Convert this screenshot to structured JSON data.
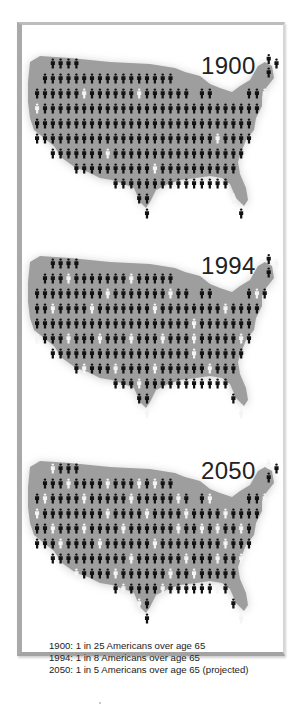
{
  "colors": {
    "map": "#9e9e9e",
    "person": "#111111",
    "elderly": "#f4f4f4",
    "frame": "#a9a9a9"
  },
  "grid": {
    "x0": 37,
    "dx": 7.85,
    "dy": 15
  },
  "maps": [
    {
      "year": "1900",
      "top": 22,
      "rows": [
        {
          "from": 2,
          "to": 5,
          "white": []
        },
        {
          "from": 1,
          "to": 17,
          "white": []
        },
        {
          "from": 0,
          "to": 19,
          "white": [
            6,
            13
          ],
          "extra": [
            21,
            22,
            27,
            28,
            29
          ],
          "extra_white": [
            29
          ]
        },
        {
          "from": 0,
          "to": 28,
          "white": [
            0
          ]
        },
        {
          "from": 0,
          "to": 27,
          "white": []
        },
        {
          "from": 0,
          "to": 27,
          "white": [
            23
          ]
        },
        {
          "from": 2,
          "to": 26,
          "white": [
            9
          ]
        },
        {
          "from": 5,
          "to": 25,
          "white": [
            15
          ]
        },
        {
          "from": 10,
          "to": 24,
          "white": []
        },
        {
          "from": 13,
          "to": 14,
          "white": [],
          "extra": [
            25
          ],
          "extra_white": [
            25
          ]
        },
        {
          "from": 14,
          "to": 14,
          "white": [],
          "extra": [
            26
          ],
          "extra_white": []
        }
      ],
      "ne": [
        {
          "c": 29.5,
          "r": 0.7,
          "w": false
        },
        {
          "c": 30.5,
          "r": 1.0,
          "w": false
        },
        {
          "c": 29.5,
          "r": 1.6,
          "w": false
        }
      ]
    },
    {
      "year": "1994",
      "top": 222,
      "rows": [
        {
          "from": 2,
          "to": 5,
          "white": []
        },
        {
          "from": 1,
          "to": 17,
          "white": [
            4,
            12
          ]
        },
        {
          "from": 0,
          "to": 19,
          "white": [
            9,
            17
          ],
          "extra": [
            21,
            22,
            27,
            28,
            29
          ],
          "extra_white": [
            28
          ]
        },
        {
          "from": 0,
          "to": 28,
          "white": [
            2,
            7,
            15,
            24
          ]
        },
        {
          "from": 0,
          "to": 27,
          "white": [
            20
          ]
        },
        {
          "from": 0,
          "to": 27,
          "white": [
            0,
            4,
            8,
            12,
            16,
            20,
            26
          ]
        },
        {
          "from": 2,
          "to": 26,
          "white": [
            20
          ]
        },
        {
          "from": 5,
          "to": 25,
          "white": [
            6,
            10,
            15,
            22
          ]
        },
        {
          "from": 10,
          "to": 24,
          "white": [
            13
          ]
        },
        {
          "from": 13,
          "to": 14,
          "white": [],
          "extra": [
            25
          ],
          "extra_white": []
        },
        {
          "from": 14,
          "to": 14,
          "white": [
            14
          ],
          "extra": [
            26
          ],
          "extra_white": [
            26
          ]
        }
      ],
      "ne": [
        {
          "c": 29.5,
          "r": 0.7,
          "w": false
        },
        {
          "c": 30.5,
          "r": 1.0,
          "w": true
        },
        {
          "c": 29.5,
          "r": 1.6,
          "w": false
        }
      ]
    },
    {
      "year": "2050",
      "top": 427,
      "rows": [
        {
          "from": 2,
          "to": 5,
          "white": [
            2
          ]
        },
        {
          "from": 1,
          "to": 17,
          "white": [
            4,
            9,
            13,
            15
          ]
        },
        {
          "from": 0,
          "to": 19,
          "white": [
            1,
            6,
            12,
            18
          ],
          "extra": [
            21,
            22,
            27,
            28,
            29
          ],
          "extra_white": [
            22,
            29
          ]
        },
        {
          "from": 0,
          "to": 28,
          "white": [
            0,
            9,
            14,
            19,
            24
          ]
        },
        {
          "from": 0,
          "to": 27,
          "white": [
            2,
            6,
            11,
            18,
            21,
            23,
            26
          ]
        },
        {
          "from": 0,
          "to": 27,
          "white": [
            3,
            8,
            15,
            24
          ]
        },
        {
          "from": 2,
          "to": 26,
          "white": [
            12,
            19,
            23,
            26
          ]
        },
        {
          "from": 5,
          "to": 25,
          "white": [
            5,
            10,
            17,
            20
          ]
        },
        {
          "from": 10,
          "to": 24,
          "white": [
            11,
            16,
            23
          ]
        },
        {
          "from": 13,
          "to": 14,
          "white": [
            13
          ],
          "extra": [
            25
          ],
          "extra_white": []
        },
        {
          "from": 14,
          "to": 14,
          "white": [],
          "extra": [
            26
          ],
          "extra_white": [
            26
          ]
        }
      ],
      "ne": [
        {
          "c": 29.5,
          "r": 0.7,
          "w": true
        },
        {
          "c": 30.5,
          "r": 1.0,
          "w": false
        },
        {
          "c": 29.5,
          "r": 1.6,
          "w": false
        }
      ]
    }
  ],
  "caption": {
    "line1": "1900: 1 in 25 Americans over age 65",
    "line2": "1994: 1 in 8 Americans over age 65",
    "line3": "2050: 1 in 5 Americans over age 65 (projected)"
  },
  "chart_data": {
    "type": "table",
    "categories": [
      "1900",
      "1994",
      "2050"
    ],
    "values": [
      0.04,
      0.125,
      0.2
    ],
    "labels": [
      "1 in 25",
      "1 in 8",
      "1 in 5 (projected)"
    ],
    "xlabel": "",
    "ylabel": "",
    "legend": {
      "black_figure": "American under 65",
      "white_figure": "American over age 65"
    }
  }
}
